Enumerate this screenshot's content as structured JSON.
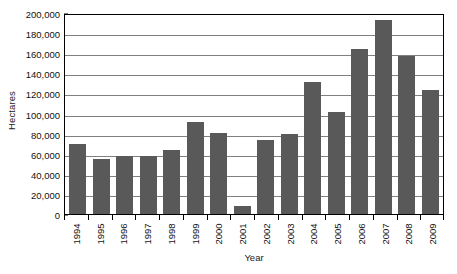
{
  "chart_data": {
    "type": "bar",
    "title": "",
    "subtitle": "",
    "xlabel": "Year",
    "ylabel": "Hectares",
    "categories": [
      "1994",
      "1995",
      "1996",
      "1997",
      "1998",
      "1999",
      "2000",
      "2001",
      "2002",
      "2003",
      "2004",
      "2005",
      "2006",
      "2007",
      "2008",
      "2009"
    ],
    "values": [
      70000,
      55000,
      58000,
      58000,
      64000,
      92000,
      81000,
      8000,
      74000,
      80000,
      131000,
      102000,
      164000,
      193000,
      157000,
      123000
    ],
    "ylim": [
      0,
      200000
    ],
    "ytick_values": [
      0,
      20000,
      40000,
      60000,
      80000,
      100000,
      120000,
      140000,
      160000,
      180000,
      200000
    ],
    "ytick_labels": [
      "0",
      "20,000",
      "40,000",
      "60,000",
      "80,000",
      "100,000",
      "120,000",
      "140,000",
      "160,000",
      "180,000",
      "200,000"
    ],
    "grid": true,
    "legend": false,
    "legend_position": "none",
    "series": [
      {
        "name": "Hectares",
        "values": [
          70000,
          55000,
          58000,
          58000,
          64000,
          92000,
          81000,
          8000,
          74000,
          80000,
          131000,
          102000,
          164000,
          193000,
          157000,
          123000
        ]
      }
    ],
    "colors": {
      "bar_fill": "#595959",
      "gridline": "#808080",
      "axis_line": "#000000",
      "plot_background": "#ffffff",
      "text": "#111111"
    }
  }
}
